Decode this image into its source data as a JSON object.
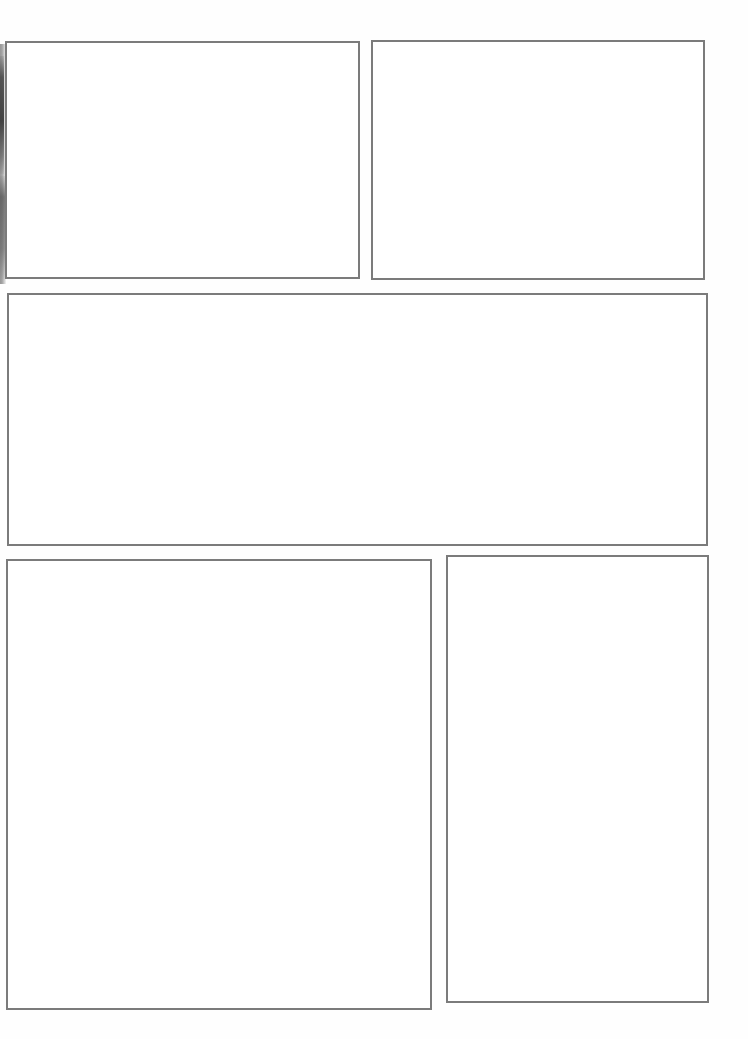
{
  "page": {
    "width": 748,
    "height": 1039,
    "background_color": "#ffffff",
    "border_color": "#7b7b7b",
    "content_text": ""
  },
  "artifacts": [
    {
      "name": "left-scan-edge",
      "description": "dark vertical scanner edge artifact at left margin",
      "color": "#5a5a5a"
    }
  ],
  "panels": [
    {
      "id": "panel-1",
      "label": "",
      "content": "",
      "position": "top-left",
      "x": 5,
      "y": 41,
      "width": 355,
      "height": 238
    },
    {
      "id": "panel-2",
      "label": "",
      "content": "",
      "position": "top-right",
      "x": 371,
      "y": 40,
      "width": 334,
      "height": 240
    },
    {
      "id": "panel-3",
      "label": "",
      "content": "",
      "position": "middle-wide",
      "x": 7,
      "y": 293,
      "width": 701,
      "height": 253
    },
    {
      "id": "panel-4",
      "label": "",
      "content": "",
      "position": "bottom-left",
      "x": 6,
      "y": 559,
      "width": 426,
      "height": 451
    },
    {
      "id": "panel-5",
      "label": "",
      "content": "",
      "position": "bottom-right",
      "x": 446,
      "y": 555,
      "width": 263,
      "height": 448
    }
  ]
}
